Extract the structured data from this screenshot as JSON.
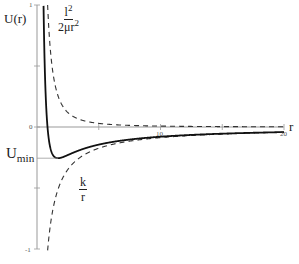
{
  "chart_data": {
    "type": "line",
    "title": "",
    "xlabel": "r",
    "ylabel": "U(r)",
    "xlim": [
      0,
      20
    ],
    "ylim": [
      -1,
      1
    ],
    "x_ticks": [
      0,
      10,
      20
    ],
    "y_ticks": [
      -1,
      0,
      1
    ],
    "x_tick_labels": [
      "10",
      "20"
    ],
    "y_tick_labels": [
      "1",
      "0",
      "-1"
    ],
    "grid": false,
    "legend": false,
    "model": {
      "repulsive_coeff": 0.74,
      "attractive_k": 0.87
    },
    "series": [
      {
        "name": "l^2/(2 mu r^2)",
        "style": "dashed",
        "color": "#222222",
        "formula": "0.74 / r^2"
      },
      {
        "name": "-k/r",
        "style": "dashed",
        "color": "#222222",
        "formula": "-0.87 / r"
      },
      {
        "name": "U(r)",
        "style": "solid",
        "color": "#111111",
        "formula": "0.74 / r^2 - 0.87 / r"
      }
    ],
    "sample_points": {
      "r": [
        0.86,
        1.0,
        1.7,
        3,
        5,
        10,
        15,
        20
      ],
      "U": [
        -0.011,
        -0.13,
        -0.256,
        -0.208,
        -0.144,
        -0.08,
        -0.055,
        -0.042
      ]
    },
    "annotations": [
      {
        "text": "l²/(2μr²)",
        "target": "repulsive dashed curve"
      },
      {
        "text": "k/r",
        "target": "attractive dashed curve"
      },
      {
        "text": "U_min",
        "value": -0.256,
        "at_r": 1.7
      }
    ]
  },
  "labels": {
    "y_axis": "U(r)",
    "x_axis": "r",
    "centrifugal_num": "l",
    "centrifugal_num_sup": "2",
    "centrifugal_den": "2μr",
    "centrifugal_den_sup": "2",
    "attractive_num": "k",
    "attractive_den": "r",
    "umin_main": "U",
    "umin_sub": "min",
    "tick_y_top": "1",
    "tick_y_zero": "0",
    "tick_y_bottom": "-1",
    "tick_x_10": "10",
    "tick_x_20": "20"
  },
  "colors": {
    "axis": "#999999",
    "curve": "#111111",
    "dashed": "#333333"
  }
}
